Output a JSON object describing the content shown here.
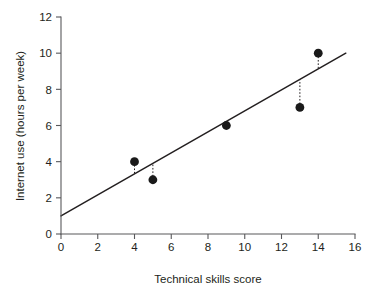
{
  "chart_data": {
    "type": "scatter",
    "title": "",
    "xlabel": "Technical skills score",
    "ylabel": "Internet use (hours per week)",
    "xlim": [
      0,
      16
    ],
    "ylim": [
      0,
      12
    ],
    "xticks": [
      0,
      2,
      4,
      6,
      8,
      10,
      12,
      14,
      16
    ],
    "yticks": [
      0,
      2,
      4,
      6,
      8,
      10,
      12
    ],
    "xtick_labels": [
      "0",
      "2",
      "4",
      "6",
      "8",
      "10",
      "12",
      "14",
      "16"
    ],
    "ytick_labels": [
      "0",
      "2",
      "4",
      "6",
      "8",
      "10",
      "12"
    ],
    "grid": false,
    "legend": false,
    "legend_position": "none",
    "series": [
      {
        "name": "Observations",
        "marker": "filled-circle",
        "color": "#1a1a1a",
        "x": [
          4,
          5,
          9,
          13,
          14
        ],
        "y": [
          4,
          3,
          6,
          7,
          10
        ],
        "points": [
          {
            "x": 4,
            "y": 4
          },
          {
            "x": 5,
            "y": 3
          },
          {
            "x": 9,
            "y": 6
          },
          {
            "x": 13,
            "y": 7
          },
          {
            "x": 14,
            "y": 10
          }
        ]
      }
    ],
    "fit_line": {
      "name": "Regression line",
      "type": "linear",
      "intercept": 1.0,
      "slope": 0.58,
      "x_start": 0,
      "x_end": 15.5,
      "y_start": 1.0,
      "y_end": 10.0,
      "color": "#231f20"
    },
    "residuals": {
      "style": "dotted-vertical",
      "color": "#231f20",
      "segments": [
        {
          "x": 4,
          "y_point": 4,
          "y_line": 3.32
        },
        {
          "x": 5,
          "y_point": 3,
          "y_line": 3.9
        },
        {
          "x": 9,
          "y_point": 6,
          "y_line": 6.22
        },
        {
          "x": 13,
          "y_point": 7,
          "y_line": 8.54
        },
        {
          "x": 14,
          "y_point": 10,
          "y_line": 9.12
        }
      ]
    },
    "colors": {
      "axis": "#58585b",
      "text": "#231f20",
      "marker": "#1a1a1a",
      "line": "#231f20",
      "background": "#ffffff"
    }
  }
}
